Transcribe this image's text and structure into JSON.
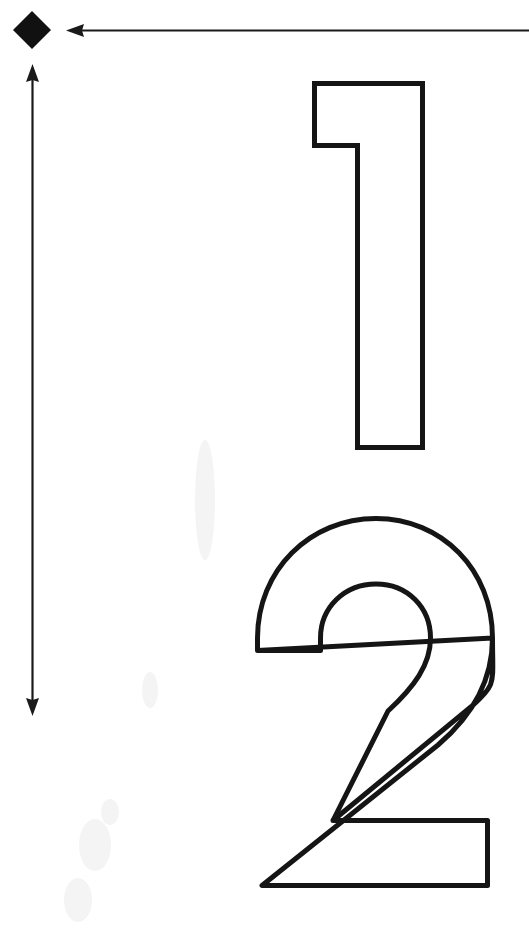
{
  "page": {
    "width": 529,
    "height": 936,
    "background_color": "#ffffff",
    "ink_color": "#151515"
  },
  "markers": {
    "diamond": {
      "name": "diamond-marker",
      "shape": "diamond",
      "fill_color": "#111111",
      "center_x": 32,
      "center_y": 30,
      "width": 38,
      "height": 38
    }
  },
  "arrows": [
    {
      "name": "horizontal-arrow",
      "direction": "left",
      "heads": 1,
      "head_position": "start",
      "from_x": 529,
      "from_y": 30,
      "to_x": 66,
      "to_y": 30,
      "color": "#1a1a1a",
      "thickness": 2.2
    },
    {
      "name": "vertical-arrow",
      "direction": "up-down",
      "heads": 2,
      "head_position": "both",
      "from_x": 32,
      "from_y": 65,
      "to_x": 32,
      "to_y": 715,
      "color": "#1a1a1a",
      "thickness": 2.2
    }
  ],
  "glyphs": [
    {
      "name": "numeral-one",
      "character": "1",
      "style": "outline",
      "stroke_color": "#151515",
      "stroke_width": 5,
      "fill": "none",
      "bbox": {
        "x": 312,
        "y": 81,
        "width": 113,
        "height": 369
      }
    },
    {
      "name": "numeral-two",
      "character": "2",
      "style": "outline",
      "stroke_color": "#151515",
      "stroke_width": 5,
      "fill": "none",
      "bbox": {
        "x": 255,
        "y": 516,
        "width": 240,
        "height": 372
      }
    }
  ],
  "labels": {
    "diagram_title": "Outlined numerals 1 and 2 with dimension arrows",
    "diamond_label": "diamond marker",
    "horizontal_arrow_label": "horizontal leftward arrow",
    "vertical_arrow_label": "vertical double-headed arrow",
    "numeral_one_label": "outlined numeral 1",
    "numeral_two_label": "outlined numeral 2"
  }
}
